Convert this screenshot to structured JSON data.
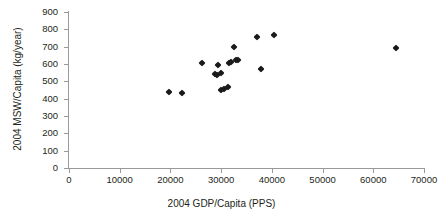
{
  "chart_data": {
    "type": "scatter",
    "title": "",
    "xlabel": "2004 GDP/Capita (PPS)",
    "ylabel": "2004 MSW/Capita (kg/year)",
    "xlim": [
      0,
      70000
    ],
    "ylim": [
      0,
      900
    ],
    "xticks": [
      "0",
      "10000",
      "20000",
      "30000",
      "40000",
      "50000",
      "60000",
      "70000"
    ],
    "yticks": [
      "0",
      "100",
      "200",
      "300",
      "400",
      "500",
      "600",
      "700",
      "800",
      "900"
    ],
    "xtick_values": [
      0,
      10000,
      20000,
      30000,
      40000,
      50000,
      60000,
      70000
    ],
    "ytick_values": [
      0,
      100,
      200,
      300,
      400,
      500,
      600,
      700,
      800,
      900
    ],
    "grid": false,
    "legend": false,
    "marker": "filled-diamond",
    "marker_color": "#1a1a1a",
    "axis_color": "#9a9a9a",
    "points": [
      {
        "x": 19700,
        "y": 437
      },
      {
        "x": 22200,
        "y": 435
      },
      {
        "x": 26300,
        "y": 608
      },
      {
        "x": 28700,
        "y": 541
      },
      {
        "x": 29200,
        "y": 536
      },
      {
        "x": 29400,
        "y": 592
      },
      {
        "x": 29900,
        "y": 546
      },
      {
        "x": 30000,
        "y": 452
      },
      {
        "x": 30500,
        "y": 455
      },
      {
        "x": 31400,
        "y": 468
      },
      {
        "x": 31600,
        "y": 604
      },
      {
        "x": 31900,
        "y": 612
      },
      {
        "x": 32600,
        "y": 698
      },
      {
        "x": 33000,
        "y": 622
      },
      {
        "x": 33400,
        "y": 625
      },
      {
        "x": 37100,
        "y": 753
      },
      {
        "x": 37800,
        "y": 574
      },
      {
        "x": 40400,
        "y": 769
      },
      {
        "x": 64400,
        "y": 695
      }
    ]
  }
}
